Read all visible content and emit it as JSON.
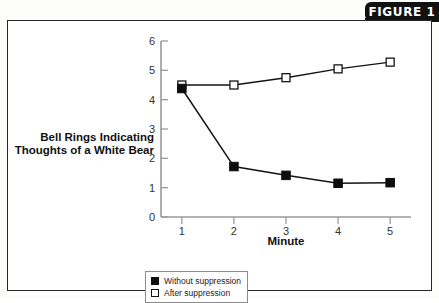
{
  "figure": {
    "tab_label": "FIGURE 1"
  },
  "chart_data": {
    "type": "line",
    "title": "",
    "xlabel": "Minute",
    "ylabel": "Bell Rings Indicating Thoughts of a White Bear",
    "ylabel_line1": "Bell Rings Indicating",
    "ylabel_line2": "Thoughts of a White Bear",
    "x": [
      1,
      2,
      3,
      4,
      5
    ],
    "xticklabels": [
      "1",
      "2",
      "3",
      "4",
      "5"
    ],
    "yticklabels": [
      "0",
      "1",
      "2",
      "3",
      "4",
      "5",
      "6"
    ],
    "xlim": [
      0.6,
      5.4
    ],
    "ylim": [
      0,
      6
    ],
    "grid": false,
    "legend_position": "bottom-left",
    "series": [
      {
        "name": "Without suppression",
        "marker": "filled-square",
        "values": [
          4.38,
          1.72,
          1.42,
          1.15,
          1.17
        ]
      },
      {
        "name": "After suppression",
        "marker": "open-square",
        "values": [
          4.5,
          4.5,
          4.75,
          5.05,
          5.28
        ]
      }
    ]
  },
  "legend": {
    "items": [
      {
        "label": "Without suppression",
        "marker": "filled-square"
      },
      {
        "label": "After suppression",
        "marker": "open-square"
      }
    ]
  }
}
